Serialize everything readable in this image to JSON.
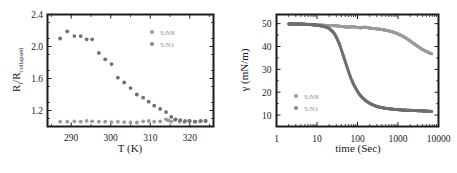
{
  "figure": {
    "background": "#ffffff",
    "panel_count": 2
  },
  "colors": {
    "series_sn8": "#9a9a9a",
    "series_sn1": "#6f6f6f",
    "axis": "#1c1c1c",
    "legend_text": "#8d8d8d"
  },
  "chart_data": [
    {
      "type": "scatter",
      "panel": "left",
      "title": "",
      "xlabel": "T (K)",
      "ylabel": "R₁/R_collapsed",
      "ylabel_main": "R",
      "ylabel_sub1": "l",
      "ylabel_mid": "/R",
      "ylabel_sub2": "collapsed",
      "xlim": [
        284,
        326
      ],
      "ylim": [
        1.0,
        2.4
      ],
      "xticks": [
        290,
        300,
        310,
        320
      ],
      "yticks": [
        1.2,
        1.6,
        2.0,
        2.4
      ],
      "xtick_labels": [
        "290",
        "300",
        "310",
        "320"
      ],
      "ytick_labels": [
        "1.2",
        "1.6",
        "2.0",
        "2.4"
      ],
      "grid": false,
      "legend_position": "upper-right",
      "series": [
        {
          "name": "S:N8",
          "color": "#9a9a9a",
          "x": [
            287.2,
            289.0,
            290.8,
            292.4,
            293.9,
            295.3,
            297.0,
            298.6,
            300.2,
            301.8,
            303.4,
            305.0,
            306.6,
            308.2,
            309.6,
            311.0,
            312.5,
            314.0,
            314.6,
            315.3,
            316.2,
            317.4,
            318.6,
            319.8,
            321.2,
            322.6,
            324.0
          ],
          "y": [
            1.06,
            1.06,
            1.065,
            1.06,
            1.07,
            1.065,
            1.06,
            1.06,
            1.055,
            1.06,
            1.055,
            1.05,
            1.05,
            1.065,
            1.07,
            1.06,
            1.065,
            1.09,
            1.075,
            1.06,
            1.08,
            1.06,
            1.055,
            1.07,
            1.06,
            1.065,
            1.07
          ]
        },
        {
          "name": "S:N1",
          "color": "#6f6f6f",
          "x": [
            287.2,
            289.0,
            290.8,
            292.4,
            293.9,
            295.3,
            297.0,
            298.6,
            300.2,
            301.8,
            303.4,
            305.0,
            306.6,
            308.2,
            309.6,
            311.0,
            312.5,
            314.0,
            315.3,
            316.4,
            317.6,
            318.8,
            320.0,
            321.4,
            322.8,
            324.0
          ],
          "y": [
            2.1,
            2.19,
            2.13,
            2.13,
            2.09,
            2.09,
            1.92,
            1.84,
            1.78,
            1.61,
            1.55,
            1.48,
            1.4,
            1.36,
            1.31,
            1.26,
            1.22,
            1.18,
            1.12,
            1.09,
            1.08,
            1.07,
            1.07,
            1.06,
            1.07,
            1.07
          ]
        }
      ]
    },
    {
      "type": "scatter",
      "panel": "right",
      "title": "",
      "xlabel": "time (Sec)",
      "ylabel": "γ (mN/m)",
      "xscale": "log",
      "xlim": [
        1,
        10000
      ],
      "ylim": [
        5,
        54
      ],
      "xticks": [
        1,
        10,
        100,
        1000,
        10000
      ],
      "yticks": [
        10,
        20,
        30,
        40,
        50
      ],
      "xtick_labels": [
        "1",
        "10",
        "100",
        "1000",
        "10000"
      ],
      "ytick_labels": [
        "10",
        "20",
        "30",
        "40",
        "50"
      ],
      "grid": false,
      "legend_position": "lower-left",
      "series": [
        {
          "name": "S:N8",
          "color": "#9a9a9a",
          "x": [
            2,
            3,
            4,
            5,
            6,
            7,
            8,
            9,
            10,
            12,
            15,
            18,
            22,
            27,
            33,
            40,
            50,
            62,
            77,
            95,
            120,
            150,
            185,
            230,
            285,
            355,
            440,
            545,
            675,
            840,
            1040,
            1290,
            1600,
            1980,
            2460,
            3050,
            3780,
            4690,
            5810,
            6800
          ],
          "y": [
            49.9,
            49.8,
            49.9,
            49.8,
            49.7,
            49.6,
            49.6,
            49.5,
            49.5,
            49.4,
            49.3,
            49.2,
            49.2,
            49.1,
            49.0,
            48.8,
            48.6,
            48.5,
            48.7,
            48.4,
            48.2,
            48.5,
            48.2,
            47.9,
            47.8,
            47.6,
            47.3,
            47.0,
            46.6,
            46.1,
            45.4,
            44.6,
            43.6,
            42.5,
            41.3,
            40.1,
            39.0,
            38.1,
            37.3,
            36.8
          ]
        },
        {
          "name": "S:N1",
          "color": "#6f6f6f",
          "x": [
            2,
            3,
            4,
            5,
            6,
            7,
            8,
            9,
            10,
            12,
            14,
            17,
            20,
            23,
            27,
            31,
            36,
            41,
            47,
            54,
            62,
            70,
            80,
            92,
            105,
            120,
            138,
            158,
            180,
            210,
            245,
            290,
            345,
            420,
            520,
            660,
            850,
            1100,
            1450,
            1900,
            2500,
            3300,
            4400,
            5800,
            6800
          ],
          "y": [
            49.9,
            49.8,
            49.8,
            49.7,
            49.6,
            49.6,
            49.5,
            49.4,
            49.3,
            49.1,
            48.9,
            48.5,
            47.9,
            47.0,
            45.6,
            43.6,
            41.0,
            38.0,
            34.8,
            31.5,
            28.4,
            25.8,
            23.5,
            21.5,
            19.8,
            18.4,
            17.3,
            16.4,
            15.7,
            15.0,
            14.4,
            13.9,
            13.5,
            13.2,
            12.9,
            12.7,
            12.5,
            12.3,
            12.2,
            12.1,
            12.0,
            11.9,
            11.8,
            11.7,
            11.6
          ]
        }
      ]
    }
  ],
  "left_panel": {
    "xlabel": "T (K)",
    "ytick_labels": [
      "2.4",
      "2.0",
      "1.6",
      "1.2"
    ],
    "xtick_labels": [
      "290",
      "300",
      "310",
      "320"
    ],
    "legend": [
      {
        "label": "S:N8",
        "color": "#9a9a9a"
      },
      {
        "label": "S:N1",
        "color": "#8a8a8a"
      }
    ]
  },
  "right_panel": {
    "xlabel": "time (Sec)",
    "ylabel": "γ (mN/m)",
    "ytick_labels": [
      "50",
      "40",
      "30",
      "20",
      "10"
    ],
    "xtick_labels": [
      "1",
      "10",
      "100",
      "1000",
      "10000"
    ],
    "legend": [
      {
        "label": "S:N8",
        "color": "#9a9a9a"
      },
      {
        "label": "S:N1",
        "color": "#8a8a8a"
      }
    ]
  }
}
